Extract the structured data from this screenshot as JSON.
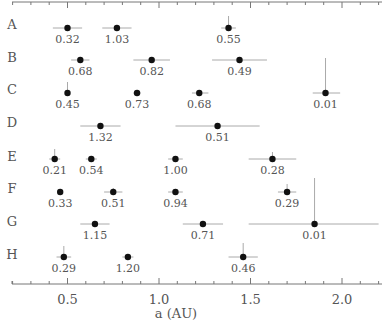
{
  "chart_data": {
    "type": "scatter",
    "title": "",
    "xlabel": "a (AU)",
    "ylabel": "",
    "xlim": [
      0.11,
      2.22
    ],
    "xticks": [
      0.5,
      1.0,
      1.5,
      2.0
    ],
    "xtick_labels": [
      "0.5",
      "1.0",
      "1.5",
      "2.0"
    ],
    "minor_tick_step": 0.1,
    "grid": false,
    "legend": null,
    "rows": [
      {
        "label": "A",
        "points": [
          {
            "x": 0.5,
            "label": "0.32",
            "xerr": [
              0.08,
              0.08
            ],
            "yerr_up": 0
          },
          {
            "x": 0.77,
            "label": "1.03",
            "xerr": [
              0.08,
              0.08
            ],
            "yerr_up": 0
          },
          {
            "x": 1.38,
            "label": "0.55",
            "xerr": [
              0.04,
              0.04
            ],
            "yerr_up": 12
          }
        ]
      },
      {
        "label": "B",
        "points": [
          {
            "x": 0.57,
            "label": "0.68",
            "xerr": [
              0.05,
              0.05
            ],
            "yerr_up": 0
          },
          {
            "x": 0.96,
            "label": "0.82",
            "xerr": [
              0.1,
              0.1
            ],
            "yerr_up": 0
          },
          {
            "x": 1.44,
            "label": "0.49",
            "xerr": [
              0.15,
              0.15
            ],
            "yerr_up": 0
          }
        ]
      },
      {
        "label": "C",
        "points": [
          {
            "x": 0.5,
            "label": "0.45",
            "xerr": [
              0.01,
              0.01
            ],
            "yerr_up": 11
          },
          {
            "x": 0.88,
            "label": "0.73",
            "xerr": [
              0.02,
              0.02
            ],
            "yerr_up": 0
          },
          {
            "x": 1.22,
            "label": "0.68",
            "xerr": [
              0.04,
              0.05
            ],
            "yerr_up": 0
          },
          {
            "x": 1.91,
            "label": "0.01",
            "xerr": [
              0.07,
              0.08
            ],
            "yerr_up": 35
          }
        ]
      },
      {
        "label": "D",
        "points": [
          {
            "x": 0.68,
            "label": "1.32",
            "xerr": [
              0.11,
              0.11
            ],
            "yerr_up": 0
          },
          {
            "x": 1.32,
            "label": "0.51",
            "xerr": [
              0.23,
              0.23
            ],
            "yerr_up": 0
          }
        ]
      },
      {
        "label": "E",
        "points": [
          {
            "x": 0.43,
            "label": "0.21",
            "xerr": [
              0.03,
              0.03
            ],
            "yerr_up": 10
          },
          {
            "x": 0.63,
            "label": "0.54",
            "xerr": [
              0.03,
              0.03
            ],
            "yerr_up": 0
          },
          {
            "x": 1.09,
            "label": "1.00",
            "xerr": [
              0.04,
              0.04
            ],
            "yerr_up": 0
          },
          {
            "x": 1.62,
            "label": "0.28",
            "xerr": [
              0.13,
              0.13
            ],
            "yerr_up": 7
          }
        ]
      },
      {
        "label": "F",
        "points": [
          {
            "x": 0.46,
            "label": "0.33",
            "xerr": [
              0.01,
              0.01
            ],
            "yerr_up": 0
          },
          {
            "x": 0.75,
            "label": "0.51",
            "xerr": [
              0.05,
              0.05
            ],
            "yerr_up": 4
          },
          {
            "x": 1.09,
            "label": "0.94",
            "xerr": [
              0.04,
              0.04
            ],
            "yerr_up": 0
          },
          {
            "x": 1.7,
            "label": "0.29",
            "xerr": [
              0.05,
              0.05
            ],
            "yerr_up": 8
          }
        ]
      },
      {
        "label": "G",
        "points": [
          {
            "x": 0.65,
            "label": "1.15",
            "xerr": [
              0.08,
              0.08
            ],
            "yerr_up": 0
          },
          {
            "x": 1.24,
            "label": "0.71",
            "xerr": [
              0.11,
              0.11
            ],
            "yerr_up": 0
          },
          {
            "x": 1.85,
            "label": "0.01",
            "xerr": [
              0.36,
              0.35
            ],
            "yerr_up": 46
          }
        ]
      },
      {
        "label": "H",
        "points": [
          {
            "x": 0.48,
            "label": "0.29",
            "xerr": [
              0.04,
              0.04
            ],
            "yerr_up": 11
          },
          {
            "x": 0.83,
            "label": "1.20",
            "xerr": [
              0.03,
              0.03
            ],
            "yerr_up": 0
          },
          {
            "x": 1.46,
            "label": "0.46",
            "xerr": [
              0.08,
              0.08
            ],
            "yerr_up": 14
          }
        ]
      }
    ]
  },
  "colors": {
    "point": "#111111",
    "errorbar": "#aaaaaa",
    "axis": "#777777",
    "text": "#555555"
  }
}
